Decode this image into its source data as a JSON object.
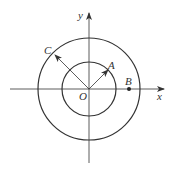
{
  "diagram": {
    "type": "concentric-circles-coordinate-plane",
    "colors": {
      "stroke": "#333333",
      "background": "#ffffff"
    },
    "axes": {
      "x_label": "x",
      "y_label": "y",
      "origin_label": "O"
    },
    "circles": [
      {
        "name": "inner",
        "radius_px": 27
      },
      {
        "name": "outer",
        "radius_px": 51
      }
    ],
    "points": {
      "A": {
        "label": "A",
        "on": "inner circle",
        "angle_deg": 45
      },
      "B": {
        "label": "B",
        "on": "x-axis between circles"
      },
      "C": {
        "label": "C",
        "on": "outer circle",
        "angle_deg": 135
      }
    }
  }
}
